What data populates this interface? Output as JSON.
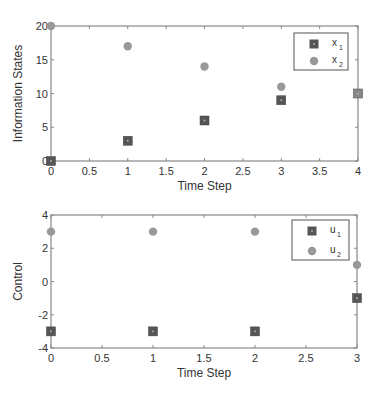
{
  "chart_data": [
    {
      "type": "scatter",
      "title": "",
      "xlabel": "Time Step",
      "ylabel": "Information States",
      "xlim": [
        0,
        4
      ],
      "ylim": [
        0,
        20
      ],
      "xticks": [
        0,
        0.5,
        1,
        1.5,
        2,
        2.5,
        3,
        3.5,
        4
      ],
      "xtick_labels": [
        "0",
        "0.5",
        "1",
        "1.5",
        "2",
        "2.5",
        "3",
        "3.5",
        "4"
      ],
      "yticks": [
        0,
        5,
        10,
        15,
        20
      ],
      "ytick_labels": [
        "0",
        "5",
        "10",
        "15",
        "20"
      ],
      "grid": false,
      "legend_position": "upper right",
      "x": [
        0,
        1,
        2,
        3,
        4
      ],
      "series": [
        {
          "name": "x1",
          "label_main": "x",
          "label_sub": "1",
          "marker": "square",
          "color": "#555555",
          "values": [
            0,
            3,
            6,
            9,
            10
          ]
        },
        {
          "name": "x2",
          "label_main": "x",
          "label_sub": "2",
          "marker": "circle",
          "color": "#999999",
          "values": [
            20,
            17,
            14,
            11,
            10
          ]
        }
      ]
    },
    {
      "type": "scatter",
      "title": "",
      "xlabel": "Time Step",
      "ylabel": "Control",
      "xlim": [
        0,
        3
      ],
      "ylim": [
        -4,
        4
      ],
      "xticks": [
        0,
        0.5,
        1,
        1.5,
        2,
        2.5,
        3
      ],
      "xtick_labels": [
        "0",
        "0.5",
        "1",
        "1.5",
        "2",
        "2.5",
        "3"
      ],
      "yticks": [
        -4,
        -2,
        0,
        2,
        4
      ],
      "ytick_labels": [
        "-4",
        "-2",
        "0",
        "2",
        "4"
      ],
      "grid": false,
      "legend_position": "upper right",
      "x": [
        0,
        1,
        2,
        3
      ],
      "series": [
        {
          "name": "u1",
          "label_main": "u",
          "label_sub": "1",
          "marker": "square",
          "color": "#555555",
          "values": [
            -3,
            -3,
            -3,
            -1
          ]
        },
        {
          "name": "u2",
          "label_main": "u",
          "label_sub": "2",
          "marker": "circle",
          "color": "#999999",
          "values": [
            3,
            3,
            3,
            1
          ]
        }
      ]
    }
  ],
  "layout": {
    "plots": [
      {
        "left": 51,
        "top": 26,
        "right": 358,
        "bottom": 161,
        "legend": {
          "x": 294,
          "y": 33,
          "w": 54,
          "h": 37
        },
        "xlabel_y": 190,
        "ylabel_x": 22
      },
      {
        "left": 51,
        "top": 215,
        "right": 357,
        "bottom": 348,
        "legend": {
          "x": 292,
          "y": 220,
          "w": 57,
          "h": 40
        },
        "xlabel_y": 377,
        "ylabel_x": 22
      }
    ],
    "axis_color": "#888888"
  }
}
